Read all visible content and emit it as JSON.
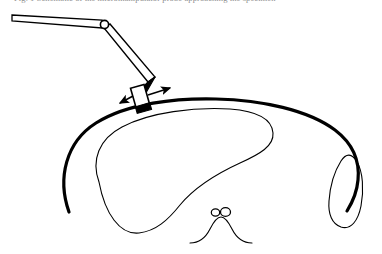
{
  "figure": {
    "caption_top_clipped": "Fig. 1  Schematic of the micromanipulator probe approaching the specimen",
    "alt_description": "Line drawing of an articulated mechanical manipulator arm with a probe tip contacting the dorsal surface of an anatomical cross-section outline",
    "background_color": "#ffffff",
    "ink_color": "#000000"
  },
  "manipulator": {
    "name": "articulated-probe-arm",
    "upper_bar": {
      "label": "upper-support-bar",
      "x1": 12,
      "y1": 16,
      "x2": 102,
      "y2": 24,
      "thickness": 7.5
    },
    "pivot_joint": {
      "label": "pivot-joint",
      "cx": 104.5,
      "cy": 24.5,
      "r": 4.1,
      "fill": "#ffffff"
    },
    "forearm": {
      "label": "forearm-link",
      "x1": 106,
      "y1": 27,
      "x2": 151,
      "y2": 79,
      "thickness": 6.5
    },
    "elbow": {
      "label": "elbow-joint",
      "cx": 151,
      "cy": 79
    },
    "wrist_link": {
      "label": "wrist-link",
      "x1": 151,
      "y1": 79,
      "x2": 141,
      "y2": 92,
      "thickness": 6.0
    },
    "probe_body": {
      "label": "probe-body",
      "cx": 140,
      "cy": 96,
      "width": 14,
      "height": 20,
      "rotation_deg": -16,
      "fill": "#ffffff"
    },
    "probe_tip": {
      "label": "probe-tip",
      "cx": 142,
      "cy": 105,
      "width": 15,
      "height": 7,
      "rotation_deg": -16,
      "fill": "#000000"
    }
  },
  "motion_arrows": [
    {
      "name": "motion-arrow-left",
      "direction": "down-left",
      "x1": 133,
      "y1": 96,
      "x2": 120,
      "y2": 103
    },
    {
      "name": "motion-arrow-right",
      "direction": "up-right",
      "x1": 148,
      "y1": 95,
      "x2": 171,
      "y2": 88
    }
  ],
  "anatomy": {
    "outer_boundary": {
      "name": "outer-boundary-arc",
      "label": "specimen-outer-wall",
      "stroke_width": 3.2,
      "open_at_bottom": true
    },
    "inner_mass": {
      "name": "inner-mass-outline",
      "label": "inner-structure",
      "stroke_width": 1.1
    },
    "right_lobe": {
      "name": "right-lobe-outline",
      "label": "lateral-lobe",
      "stroke_width": 1.1
    },
    "central_feature": {
      "name": "central-feature",
      "label": "midline-eminence",
      "stroke_width": 1.1,
      "circles": [
        {
          "name": "central-circle-left",
          "cx": 215.5,
          "cy": 212.5,
          "rx": 4.2,
          "ry": 3.6
        },
        {
          "name": "central-circle-right",
          "cx": 225.5,
          "cy": 212.0,
          "rx": 5.0,
          "ry": 4.4
        }
      ]
    }
  }
}
